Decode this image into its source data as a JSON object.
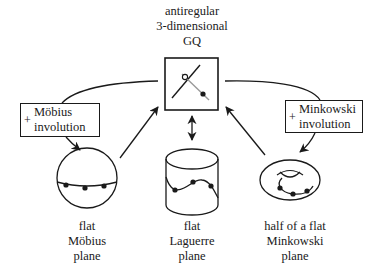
{
  "diagram": {
    "top_node": {
      "lines": [
        "antiregular",
        "3-dimensional",
        "GQ"
      ]
    },
    "left_operation": {
      "symbol": "+",
      "lines": [
        "Möbius",
        "involution"
      ]
    },
    "right_operation": {
      "symbol": "+",
      "lines": [
        "Minkowski",
        "involution"
      ]
    },
    "bottom_nodes": [
      {
        "shape": "sphere",
        "lines": [
          "flat",
          "Möbius",
          "plane"
        ]
      },
      {
        "shape": "cylinder",
        "lines": [
          "flat",
          "Laguerre",
          "plane"
        ]
      },
      {
        "shape": "torus",
        "lines": [
          "half of a flat",
          "Minkowski",
          "plane"
        ]
      }
    ],
    "edges": [
      {
        "from": "sphere",
        "to": "top_node",
        "type": "arrow"
      },
      {
        "from": "cylinder",
        "to": "top_node",
        "type": "double-arrow"
      },
      {
        "from": "torus",
        "to": "top_node",
        "type": "arrow"
      },
      {
        "from": "top_node",
        "to": "sphere",
        "via": "left_operation",
        "type": "curved-arrow"
      },
      {
        "from": "top_node",
        "to": "torus",
        "via": "right_operation",
        "type": "curved-arrow"
      }
    ],
    "colors": {
      "stroke": "#1a1a1a",
      "secondary_stroke": "#9a9a9a",
      "background": "#ffffff"
    }
  }
}
